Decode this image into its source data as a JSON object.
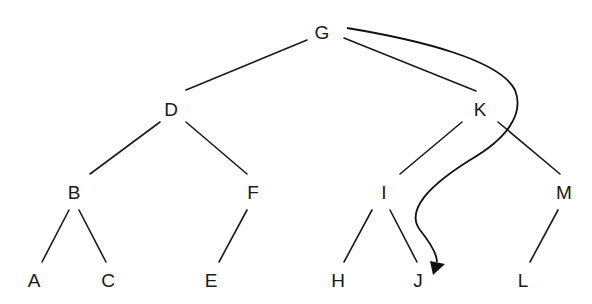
{
  "diagram": {
    "type": "binary-tree",
    "nodes": [
      {
        "id": "G",
        "label": "G",
        "x": 322,
        "y": 32
      },
      {
        "id": "D",
        "label": "D",
        "x": 171,
        "y": 109
      },
      {
        "id": "K",
        "label": "K",
        "x": 480,
        "y": 109
      },
      {
        "id": "B",
        "label": "B",
        "x": 74,
        "y": 192
      },
      {
        "id": "F",
        "label": "F",
        "x": 253,
        "y": 192
      },
      {
        "id": "I",
        "label": "I",
        "x": 384,
        "y": 192
      },
      {
        "id": "M",
        "label": "M",
        "x": 564,
        "y": 192
      },
      {
        "id": "A",
        "label": "A",
        "x": 34,
        "y": 280
      },
      {
        "id": "C",
        "label": "C",
        "x": 108,
        "y": 280
      },
      {
        "id": "E",
        "label": "E",
        "x": 211,
        "y": 280
      },
      {
        "id": "H",
        "label": "H",
        "x": 338,
        "y": 280
      },
      {
        "id": "J",
        "label": "J",
        "x": 418,
        "y": 280
      },
      {
        "id": "L",
        "label": "L",
        "x": 523,
        "y": 280
      }
    ],
    "edges": [
      {
        "from": "G",
        "to": "D",
        "x1": 307,
        "y1": 40,
        "x2": 186,
        "y2": 90
      },
      {
        "from": "G",
        "to": "K",
        "x1": 344,
        "y1": 38,
        "x2": 476,
        "y2": 91
      },
      {
        "from": "D",
        "to": "B",
        "x1": 160,
        "y1": 122,
        "x2": 90,
        "y2": 174
      },
      {
        "from": "D",
        "to": "F",
        "x1": 186,
        "y1": 122,
        "x2": 247,
        "y2": 174
      },
      {
        "from": "K",
        "to": "I",
        "x1": 502,
        "y1": 122,
        "x2": 400,
        "y2": 174
      },
      {
        "from": "K",
        "to": "M",
        "x1": 538,
        "y1": 122,
        "x2": 560,
        "y2": 174
      },
      {
        "from": "B",
        "to": "A",
        "x1": 69,
        "y1": 210,
        "x2": 42,
        "y2": 262
      },
      {
        "from": "B",
        "to": "C",
        "x1": 79,
        "y1": 210,
        "x2": 106,
        "y2": 262
      },
      {
        "from": "F",
        "to": "E",
        "x1": 247,
        "y1": 210,
        "x2": 219,
        "y2": 262
      },
      {
        "from": "I",
        "to": "H",
        "x1": 372,
        "y1": 210,
        "x2": 344,
        "y2": 262
      },
      {
        "from": "I",
        "to": "J",
        "x1": 390,
        "y1": 210,
        "x2": 417,
        "y2": 262
      },
      {
        "from": "M",
        "to": "L",
        "x1": 558,
        "y1": 210,
        "x2": 530,
        "y2": 262
      }
    ],
    "arrow": {
      "from": "G",
      "to": "J",
      "description": "curved traversal arrow from G around K down to J"
    }
  }
}
